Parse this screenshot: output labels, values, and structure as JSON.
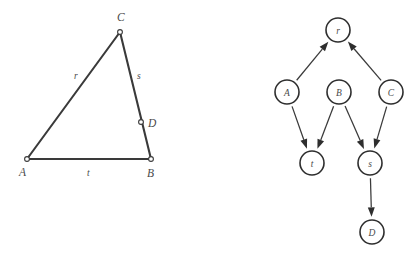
{
  "figure": {
    "background_color": "#ffffff",
    "line_color": "#3a3a3a",
    "label_color": "#4a4a4a"
  },
  "triangle": {
    "name": "triangle-diagram",
    "vertices": [
      {
        "id": "A",
        "label": "A",
        "x": 27,
        "y": 159,
        "label_x": 19,
        "label_y": 176
      },
      {
        "id": "B",
        "label": "B",
        "x": 151,
        "y": 159,
        "label_x": 147,
        "label_y": 177
      },
      {
        "id": "C",
        "label": "C",
        "x": 120,
        "y": 32,
        "label_x": 117,
        "label_y": 21
      }
    ],
    "interior_points": [
      {
        "id": "D",
        "label": "D",
        "x": 141,
        "y": 122,
        "label_x": 148,
        "label_y": 127
      }
    ],
    "sides": [
      {
        "id": "r",
        "label": "r",
        "from": "A",
        "to": "C",
        "label_x": 74,
        "label_y": 79
      },
      {
        "id": "s",
        "label": "s",
        "from": "C",
        "to": "B",
        "label_x": 137,
        "label_y": 79
      },
      {
        "id": "t",
        "label": "t",
        "from": "A",
        "to": "B",
        "label_x": 87,
        "label_y": 176
      }
    ]
  },
  "graph": {
    "name": "dependency-graph",
    "nodes": [
      {
        "id": "r",
        "label": "r",
        "x": 338,
        "y": 30,
        "r": 12
      },
      {
        "id": "A",
        "label": "A",
        "x": 287,
        "y": 92,
        "r": 12
      },
      {
        "id": "B",
        "label": "B",
        "x": 339,
        "y": 92,
        "r": 12
      },
      {
        "id": "C",
        "label": "C",
        "x": 391,
        "y": 92,
        "r": 12
      },
      {
        "id": "t",
        "label": "t",
        "x": 312,
        "y": 163,
        "r": 12
      },
      {
        "id": "s",
        "label": "s",
        "x": 370,
        "y": 163,
        "r": 12
      },
      {
        "id": "D",
        "label": "D",
        "x": 372,
        "y": 232,
        "r": 12
      }
    ],
    "edges": [
      {
        "id": "A-to-r",
        "from": "A",
        "to": "r"
      },
      {
        "id": "C-to-r",
        "from": "C",
        "to": "r"
      },
      {
        "id": "A-to-t",
        "from": "A",
        "to": "t"
      },
      {
        "id": "B-to-t",
        "from": "B",
        "to": "t"
      },
      {
        "id": "B-to-s",
        "from": "B",
        "to": "s"
      },
      {
        "id": "C-to-s",
        "from": "C",
        "to": "s"
      },
      {
        "id": "s-to-D",
        "from": "s",
        "to": "D"
      }
    ]
  }
}
